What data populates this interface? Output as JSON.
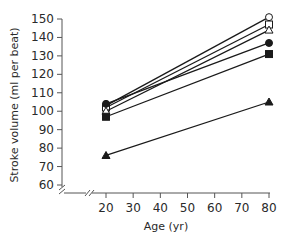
{
  "chart_data": {
    "type": "line",
    "title": "",
    "xlabel": "Age (yr)",
    "ylabel": "Stroke volume (ml per beat)",
    "xlim": [
      20,
      80
    ],
    "ylim": [
      60,
      150
    ],
    "x_ticks": [
      20,
      30,
      40,
      50,
      60,
      70,
      80
    ],
    "y_ticks": [
      60,
      70,
      80,
      90,
      100,
      110,
      120,
      130,
      140,
      150
    ],
    "axis_breaks": true,
    "grid": false,
    "legend": null,
    "x": [
      20,
      80
    ],
    "series": [
      {
        "name": "open circle",
        "marker": "circle-open",
        "values": [
          103,
          151
        ]
      },
      {
        "name": "open square",
        "marker": "square-open",
        "values": [
          102,
          147
        ]
      },
      {
        "name": "open triangle",
        "marker": "triangle-open",
        "values": [
          100,
          144
        ]
      },
      {
        "name": "filled circle",
        "marker": "circle-filled",
        "values": [
          104,
          137
        ]
      },
      {
        "name": "filled square",
        "marker": "square-filled",
        "values": [
          97,
          131
        ]
      },
      {
        "name": "filled triangle",
        "marker": "triangle-filled",
        "values": [
          76,
          105
        ]
      }
    ]
  },
  "colors": {
    "line": "#1a1a1a",
    "axis": "#555555",
    "text": "#2a2a2a"
  }
}
